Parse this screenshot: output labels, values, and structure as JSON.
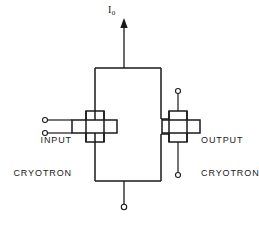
{
  "diagram": {
    "title_current_label": "I",
    "current_subscript": "0",
    "input_label_line1": "INPUT",
    "input_label_line2": "CRYOTRON",
    "output_label_line1": "OUTPUT",
    "output_label_line2": "CRYOTRON",
    "line_color": "#1a1a1a",
    "background_color": "#ffffff",
    "terminal_fill": "#ffffff"
  }
}
